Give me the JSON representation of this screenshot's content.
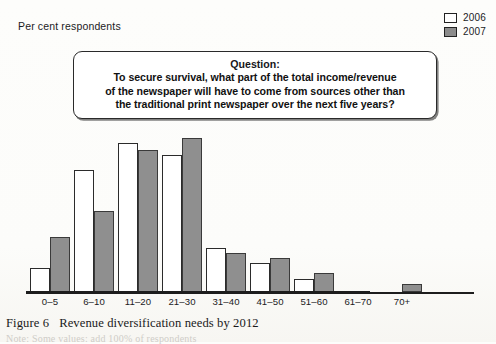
{
  "axis": {
    "ylabel": "Per cent respondents"
  },
  "legend": {
    "items": [
      {
        "label": "2006",
        "color": "#ffffff",
        "swatch_icon": "legend-swatch-white"
      },
      {
        "label": "2007",
        "color": "#8f8f8f",
        "swatch_icon": "legend-swatch-gray"
      }
    ]
  },
  "question_box": {
    "title": "Question:",
    "lines": [
      "To secure survival, what part of the total income/revenue",
      "of the newspaper will have to come from sources other than",
      "the traditional print newspaper over the next five years?"
    ]
  },
  "caption": {
    "figure_number": "Figure 6",
    "title": "Revenue diversification needs by 2012"
  },
  "note": {
    "text": "Note: Some values: add 100% of respondents"
  },
  "chart_data": {
    "type": "bar",
    "title": "Revenue diversification needs by 2012",
    "xlabel": "",
    "ylabel": "Per cent respondents",
    "grid": false,
    "legend_position": "top-right",
    "ylim": [
      0,
      160
    ],
    "categories": [
      "0–5",
      "6–10",
      "11–20",
      "21–30",
      "31–40",
      "41–50",
      "51–60",
      "61–70",
      "70+"
    ],
    "series": [
      {
        "name": "2006",
        "color": "#ffffff",
        "values": [
          24,
          122,
          149,
          137,
          44,
          29,
          13,
          0,
          0
        ]
      },
      {
        "name": "2007",
        "color": "#8f8f8f",
        "values": [
          55,
          81,
          142,
          154,
          39,
          34,
          19,
          0,
          8
        ]
      }
    ]
  }
}
